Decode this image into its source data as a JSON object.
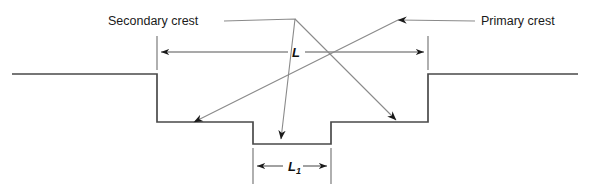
{
  "figure": {
    "labels": {
      "secondary_crest": "Secondary crest",
      "primary_crest": "Primary crest",
      "length_major": "L",
      "length_minor_base": "L",
      "length_minor_subscript": "1"
    },
    "colors": {
      "background": "#ffffff",
      "profile_stroke": "#4a4a4a",
      "dimension_stroke": "#555555",
      "leader_stroke": "#8a8a8a",
      "arrow_fill": "#1a1a1a",
      "text": "#1a1a1a"
    },
    "geometry": {
      "ground_level_y": 74,
      "outer_trench_floor_y": 122,
      "inner_notch_floor_y": 144,
      "left_ground_start_x": 12,
      "left_shoulder_x": 157,
      "inner_notch_left_x": 253,
      "inner_notch_right_x": 331,
      "right_shoulder_x": 428,
      "right_ground_end_x": 578,
      "dimension_L_y": 52,
      "dimension_L1_y": 166
    }
  }
}
